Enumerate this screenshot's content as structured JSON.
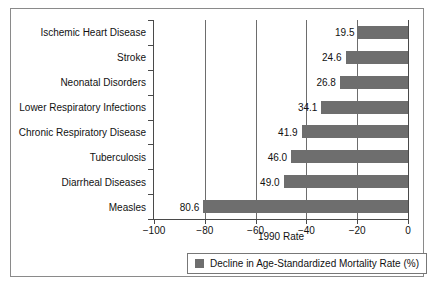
{
  "chart_data": {
    "type": "bar",
    "orientation": "horizontal",
    "title": "",
    "xlabel": "1990 Rate",
    "ylabel": "",
    "xlim": [
      -100,
      0
    ],
    "xticks": [
      -100,
      -80,
      -60,
      -40,
      -20,
      0
    ],
    "xtick_labels": [
      "−100",
      "−80",
      "−60",
      "−40",
      "−20",
      "0"
    ],
    "grid": true,
    "grid_axis": "x",
    "legend_position": "bottom-center",
    "series": [
      {
        "name": "Decline in Age-Standardized Mortality Rate (%)",
        "color": "#6e6e6e",
        "values": [
          -19.5,
          -24.6,
          -26.8,
          -34.1,
          -41.9,
          -46.0,
          -49.0,
          -80.6
        ]
      }
    ],
    "categories": [
      "Ischemic Heart Disease",
      "Stroke",
      "Neonatal Disorders",
      "Lower Respiratory Infections",
      "Chronic Respiratory Disease",
      "Tuberculosis",
      "Diarrheal Diseases",
      "Measles"
    ],
    "data_labels": [
      "19.5",
      "24.6",
      "26.8",
      "34.1",
      "41.9",
      "46.0",
      "49.0",
      "80.6"
    ],
    "points": [
      {
        "category": "Ischemic Heart Disease",
        "value": -19.5,
        "label": "19.5"
      },
      {
        "category": "Stroke",
        "value": -24.6,
        "label": "24.6"
      },
      {
        "category": "Neonatal Disorders",
        "value": -26.8,
        "label": "26.8"
      },
      {
        "category": "Lower Respiratory Infections",
        "value": -34.1,
        "label": "34.1"
      },
      {
        "category": "Chronic Respiratory Disease",
        "value": -41.9,
        "label": "41.9"
      },
      {
        "category": "Tuberculosis",
        "value": -46.0,
        "label": "46.0"
      },
      {
        "category": "Diarrheal Diseases",
        "value": -49.0,
        "label": "49.0"
      },
      {
        "category": "Measles",
        "value": -80.6,
        "label": "80.6"
      }
    ]
  },
  "legend": {
    "entries": [
      {
        "label": "Decline in Age-Standardized Mortality Rate (%)",
        "color": "#6e6e6e"
      }
    ]
  },
  "colors": {
    "bar": "#6e6e6e",
    "axis": "#4a4a4a",
    "grid": "#6d6d6d",
    "frame": "#8a8a8a",
    "background": "#ffffff",
    "text": "#111111"
  }
}
